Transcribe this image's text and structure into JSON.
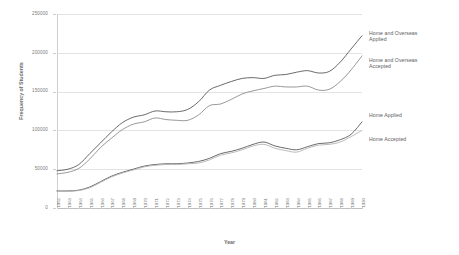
{
  "chart_data": {
    "type": "line",
    "title": "",
    "xlabel": "Year",
    "ylabel": "Frequency of Students",
    "grid": true,
    "legend_position": "inline-right",
    "ylim": [
      0,
      250000
    ],
    "yticks": [
      "0",
      "50000",
      "100000",
      "150000",
      "200000",
      "250000"
    ],
    "ytick_values": [
      0,
      50000,
      100000,
      150000,
      200000,
      250000
    ],
    "categories": [
      "1962",
      "1963",
      "1964",
      "1965",
      "1966",
      "1967",
      "1968",
      "1969",
      "1970",
      "1971",
      "1972",
      "1973",
      "1974",
      "1975",
      "1976",
      "1977",
      "1978",
      "1979",
      "1980",
      "1981",
      "1982",
      "1983",
      "1984",
      "1985",
      "1986",
      "1987",
      "1988",
      "1989",
      "1990"
    ],
    "series": [
      {
        "name": "Home and Overseas Applied",
        "color": "#595959",
        "values": [
          48000,
          50000,
          56000,
          70000,
          84000,
          98000,
          110000,
          117000,
          120000,
          125000,
          124000,
          124000,
          127000,
          137000,
          152000,
          158000,
          163000,
          167000,
          168000,
          167000,
          171000,
          172000,
          175000,
          177000,
          174000,
          176000,
          188000,
          205000,
          222000
        ]
      },
      {
        "name": "Home and Overseas Accepted",
        "color": "#8c8c8c",
        "values": [
          44000,
          46000,
          51000,
          63000,
          78000,
          90000,
          101000,
          108000,
          111000,
          116000,
          114000,
          113000,
          113000,
          120000,
          132000,
          134000,
          140000,
          147000,
          151000,
          154000,
          157000,
          156000,
          156000,
          157000,
          152000,
          153000,
          163000,
          178000,
          196000
        ]
      },
      {
        "name": "Home Applied",
        "color": "#595959",
        "values": [
          22000,
          22000,
          23000,
          27000,
          34000,
          41000,
          46000,
          50000,
          54000,
          56000,
          57000,
          57000,
          58000,
          60000,
          64000,
          70000,
          73000,
          77000,
          82000,
          85000,
          80000,
          77000,
          75000,
          79000,
          83000,
          84000,
          88000,
          95000,
          111000
        ]
      },
      {
        "name": "Home Accepted",
        "color": "#b3b3b3",
        "values": [
          21500,
          21500,
          22500,
          26000,
          33000,
          40000,
          45000,
          49000,
          53000,
          55000,
          56000,
          56000,
          57000,
          58000,
          62000,
          68000,
          71000,
          75000,
          80000,
          82000,
          77000,
          74000,
          72000,
          77000,
          81000,
          82000,
          85000,
          92000,
          100000
        ]
      }
    ],
    "annotations": [
      {
        "text": "Home and Overseas\nApplied",
        "x": 369,
        "y": 30
      },
      {
        "text": "Home and Overseas\nAccepted",
        "x": 369,
        "y": 57
      },
      {
        "text": "Home Applied",
        "x": 369,
        "y": 112
      },
      {
        "text": "Home Accepted",
        "x": 369,
        "y": 136
      }
    ]
  }
}
